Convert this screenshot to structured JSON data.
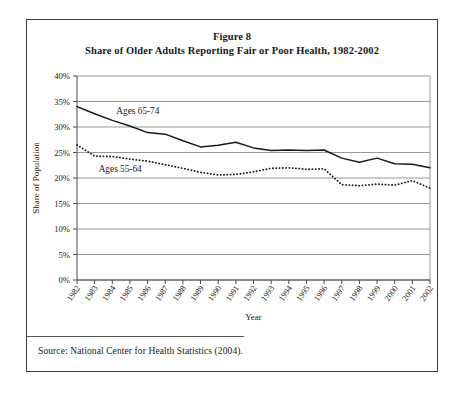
{
  "figure": {
    "title_line1": "Figure 8",
    "title_line2": "Share of Older Adults Reporting Fair or Poor Health, 1982-2002",
    "source": "Source: National Center for Health Statistics (2004)."
  },
  "chart_data": {
    "type": "line",
    "title": "Share of Older Adults Reporting Fair or Poor Health, 1982-2002",
    "subtitle": "Figure 8",
    "xlabel": "Year",
    "ylabel": "Share of Population",
    "grid": true,
    "legend": "inline-labels",
    "ylim": [
      0,
      40
    ],
    "ytick_values": [
      0,
      5,
      10,
      15,
      20,
      25,
      30,
      35,
      40
    ],
    "ytick_labels": [
      "0%",
      "5%",
      "10%",
      "15%",
      "20%",
      "25%",
      "30%",
      "35%",
      "40%"
    ],
    "categories": [
      "1982",
      "1983",
      "1984",
      "1985",
      "1986",
      "1987",
      "1988",
      "1989",
      "1990",
      "1991",
      "1992",
      "1993",
      "1994",
      "1995",
      "1996",
      "1997",
      "1998",
      "1999",
      "2000",
      "2001",
      "2002"
    ],
    "series": [
      {
        "name": "Ages 65-74",
        "style": "solid",
        "color": "#1a1a1a",
        "values": [
          34.0,
          32.6,
          31.3,
          30.2,
          28.9,
          28.6,
          27.3,
          26.1,
          26.4,
          27.0,
          25.9,
          25.4,
          25.5,
          25.4,
          25.5,
          23.9,
          23.1,
          23.9,
          22.8,
          22.7,
          22.0
        ]
      },
      {
        "name": "Ages 55-64",
        "style": "dotted",
        "color": "#1a1a1a",
        "values": [
          26.5,
          24.3,
          24.2,
          23.7,
          23.3,
          22.6,
          21.9,
          21.1,
          20.6,
          20.7,
          21.2,
          21.9,
          22.0,
          21.7,
          21.8,
          18.7,
          18.5,
          18.8,
          18.6,
          19.5,
          18.0
        ]
      }
    ],
    "annotations": [
      {
        "text": "Ages 65-74",
        "x": "1984",
        "y": 32.5
      },
      {
        "text": "Ages 55-64",
        "x": "1983",
        "y": 21.2
      }
    ]
  }
}
